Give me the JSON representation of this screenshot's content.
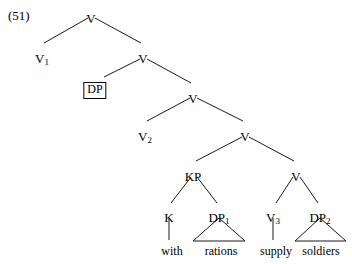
{
  "figure": {
    "example_number": "(51)",
    "type": "syntax-tree",
    "line_color": "#1a1a1a",
    "text_color": "#000000",
    "background_color": "#ffffff"
  },
  "nodes": [
    {
      "id": "v-root",
      "label": "V",
      "sub": "",
      "x": 91,
      "y": 12,
      "boxed": false
    },
    {
      "id": "v1",
      "label": "V",
      "sub": "1",
      "x": 42,
      "y": 52,
      "boxed": false
    },
    {
      "id": "v-2nd",
      "label": "V",
      "sub": "",
      "x": 143,
      "y": 52,
      "boxed": false
    },
    {
      "id": "dp-boxed",
      "label": "DP",
      "sub": "",
      "x": 95,
      "y": 82,
      "boxed": true
    },
    {
      "id": "v-3rd",
      "label": "V",
      "sub": "",
      "x": 193,
      "y": 92,
      "boxed": false
    },
    {
      "id": "v2",
      "label": "V",
      "sub": "2",
      "x": 145,
      "y": 130,
      "boxed": false
    },
    {
      "id": "v-4th",
      "label": "V",
      "sub": "",
      "x": 245,
      "y": 130,
      "boxed": false
    },
    {
      "id": "kp",
      "label": "KP",
      "sub": "",
      "x": 193,
      "y": 170,
      "boxed": false
    },
    {
      "id": "v-5th",
      "label": "V",
      "sub": "",
      "x": 296,
      "y": 170,
      "boxed": false
    },
    {
      "id": "k",
      "label": "K",
      "sub": "",
      "x": 169,
      "y": 211,
      "boxed": false
    },
    {
      "id": "dp1",
      "label": "DP",
      "sub": "1",
      "x": 219,
      "y": 211,
      "boxed": false
    },
    {
      "id": "v3",
      "label": "V",
      "sub": "3",
      "x": 273,
      "y": 211,
      "boxed": false
    },
    {
      "id": "dp2",
      "label": "DP",
      "sub": "2",
      "x": 320,
      "y": 211,
      "boxed": false
    }
  ],
  "edges": [
    {
      "from": "v-root",
      "to": "v1",
      "x1": 88,
      "y1": 18,
      "x2": 44,
      "y2": 43
    },
    {
      "from": "v-root",
      "to": "v-2nd",
      "x1": 95,
      "y1": 18,
      "x2": 141,
      "y2": 43
    },
    {
      "from": "v-2nd",
      "to": "dp-boxed",
      "x1": 140,
      "y1": 59,
      "x2": 104,
      "y2": 77
    },
    {
      "from": "v-2nd",
      "to": "v-3rd",
      "x1": 147,
      "y1": 59,
      "x2": 191,
      "y2": 83
    },
    {
      "from": "v-3rd",
      "to": "v2",
      "x1": 190,
      "y1": 98,
      "x2": 147,
      "y2": 121
    },
    {
      "from": "v-3rd",
      "to": "v-4th",
      "x1": 197,
      "y1": 98,
      "x2": 243,
      "y2": 121
    },
    {
      "from": "v-4th",
      "to": "kp",
      "x1": 242,
      "y1": 137,
      "x2": 196,
      "y2": 161
    },
    {
      "from": "v-4th",
      "to": "v-5th",
      "x1": 249,
      "y1": 137,
      "x2": 294,
      "y2": 161
    },
    {
      "from": "kp",
      "to": "k",
      "x1": 191,
      "y1": 177,
      "x2": 171,
      "y2": 203
    },
    {
      "from": "kp",
      "to": "dp1",
      "x1": 197,
      "y1": 177,
      "x2": 217,
      "y2": 203
    },
    {
      "from": "v-5th",
      "to": "v3",
      "x1": 293,
      "y1": 177,
      "x2": 276,
      "y2": 203
    },
    {
      "from": "v-5th",
      "to": "dp2",
      "x1": 300,
      "y1": 177,
      "x2": 318,
      "y2": 203
    },
    {
      "from": "k",
      "to": "leaf-with",
      "x1": 169,
      "y1": 218,
      "x2": 169,
      "y2": 240
    },
    {
      "from": "v3",
      "to": "leaf-supply",
      "x1": 273,
      "y1": 218,
      "x2": 273,
      "y2": 240
    }
  ],
  "triangles": [
    {
      "id": "tri-rations",
      "apex_x": 219,
      "apex_y": 218,
      "left_x": 193,
      "right_x": 245,
      "base_y": 241
    },
    {
      "id": "tri-soldiers",
      "apex_x": 320,
      "apex_y": 218,
      "left_x": 295,
      "right_x": 346,
      "base_y": 241
    }
  ],
  "leaves": [
    {
      "id": "leaf-with",
      "label": "with",
      "x": 172,
      "y": 245
    },
    {
      "id": "leaf-rations",
      "label": "rations",
      "x": 221,
      "y": 245
    },
    {
      "id": "leaf-supply",
      "label": "supply",
      "x": 276,
      "y": 245
    },
    {
      "id": "leaf-soldiers",
      "label": "soldiers",
      "x": 321,
      "y": 245
    }
  ]
}
